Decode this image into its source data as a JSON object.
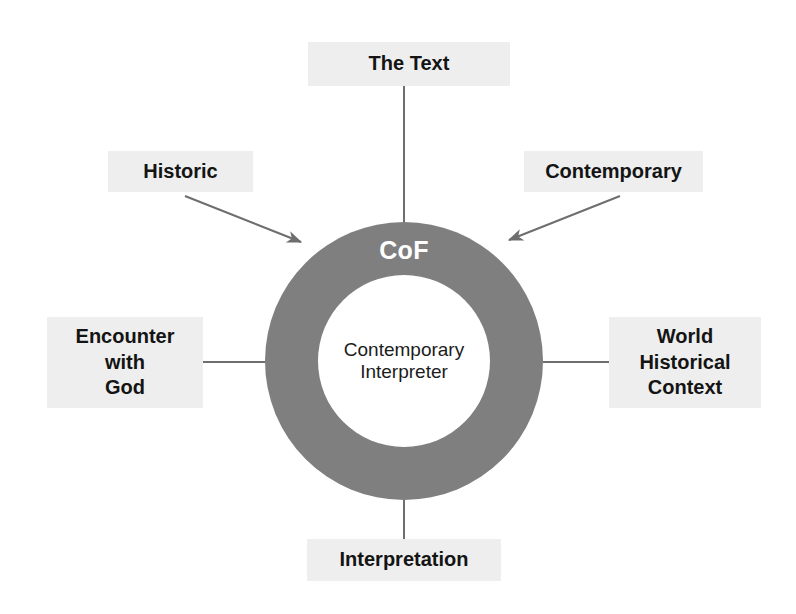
{
  "diagram": {
    "title_hidden": "",
    "center": {
      "ring_label": "CoF",
      "inner_label_line1": "Contemporary",
      "inner_label_line2": "Interpreter"
    },
    "nodes": [
      {
        "id": "the-text",
        "label": "The Text",
        "position": "top",
        "connector": "line"
      },
      {
        "id": "historic",
        "label": "Historic",
        "position": "top-left",
        "connector": "arrow"
      },
      {
        "id": "contemporary",
        "label": "Contemporary",
        "position": "top-right",
        "connector": "arrow"
      },
      {
        "id": "encounter-with-god",
        "label_line1": "Encounter",
        "label_line2": "with",
        "label_line3": "God",
        "position": "left",
        "connector": "line"
      },
      {
        "id": "world-historical-context",
        "label_line1": "World",
        "label_line2": "Historical",
        "label_line3": "Context",
        "position": "right",
        "connector": "line"
      },
      {
        "id": "interpretation",
        "label": "Interpretation",
        "position": "bottom",
        "connector": "line"
      }
    ],
    "colors": {
      "ring_fill": "#7f7f7f",
      "ring_text": "#ffffff",
      "node_fill": "#eeeeee",
      "node_text": "#141414",
      "connector": "#6e6e6e",
      "background": "#ffffff"
    }
  }
}
